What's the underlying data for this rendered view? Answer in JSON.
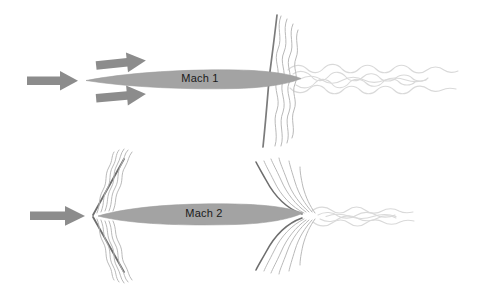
{
  "figure": {
    "name": "supersonic-flow-comparison",
    "background_color": "#ffffff",
    "width": 495,
    "height": 285
  },
  "colors": {
    "arrow_gray": "#8c8c8c",
    "body_gray": "#a3a3a3",
    "body_edge_gray": "#9a9a9a",
    "shock_dark": "#6e6e6e",
    "shock_mid": "#9c9c9c",
    "wave_light": "#c9c9c9",
    "turbulence_light": "#dcdcdc",
    "label_text": "#1a1a1a"
  },
  "panels": [
    {
      "id": "panel-mach-1",
      "label": "Mach 1",
      "body": {
        "nose_x": 86,
        "tail_x": 300,
        "center_y": 79,
        "max_half_height": 9
      },
      "flow_arrows": [
        {
          "name": "inflow-arrow-center",
          "x1": 28,
          "y1": 81,
          "x2": 76,
          "y2": 81,
          "thickness": 8
        },
        {
          "name": "inflow-arrow-upper",
          "x1": 95,
          "y1": 66,
          "x2": 150,
          "y2": 60,
          "thickness": 8
        },
        {
          "name": "inflow-arrow-lower",
          "x1": 95,
          "y1": 96,
          "x2": 150,
          "y2": 92,
          "thickness": 8
        }
      ],
      "shock": {
        "type": "normal",
        "description": "near-vertical normal shock",
        "x_top": 276,
        "y_top": 16,
        "x_bottom": 264,
        "y_bottom": 146
      },
      "wave_lines_count": 4,
      "turbulent_wake": {
        "start_x": 288,
        "end_x": 462,
        "center_y": 79,
        "max_half_height": 11
      }
    },
    {
      "id": "panel-mach-2",
      "label": "Mach 2",
      "body": {
        "nose_x": 98,
        "tail_x": 300,
        "center_y": 216,
        "max_half_height": 11
      },
      "flow_arrows": [
        {
          "name": "inflow-arrow-center",
          "x1": 30,
          "y1": 216,
          "x2": 86,
          "y2": 216,
          "thickness": 8
        }
      ],
      "shock": {
        "type": "oblique",
        "description": "oblique V-shaped bow shock at nose",
        "apex_x": 93,
        "apex_y": 215,
        "upper_end_x": 123,
        "upper_end_y": 160,
        "lower_end_x": 123,
        "lower_end_y": 270
      },
      "tail_shock": {
        "type": "oblique-fan",
        "description": "expansion fan spreading from tail",
        "origin_x": 300,
        "origin_y": 216,
        "upper_end_x": 262,
        "upper_end_y": 165,
        "lower_end_x": 262,
        "lower_end_y": 268
      },
      "wave_lines_count": 5,
      "turbulent_wake": {
        "start_x": 308,
        "end_x": 420,
        "center_y": 216,
        "max_half_height": 7
      }
    }
  ],
  "annotations": {
    "mach1_caption": "Mach 1",
    "mach2_caption": "Mach 2"
  }
}
